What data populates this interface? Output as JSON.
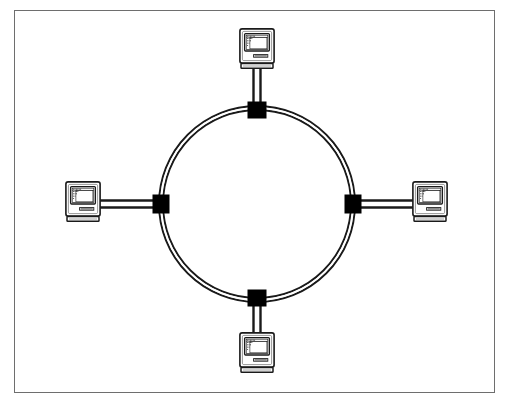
{
  "figure": {
    "title": "Ring network topology diagram",
    "caption": "",
    "frame": {
      "border_color": "#6e6e6e",
      "background_color": "#ffffff",
      "x": 14,
      "y": 10,
      "width": 481,
      "height": 383
    }
  },
  "diagram": {
    "type": "network-topology",
    "topology_name": "ring",
    "line_color": "#1a1a1a",
    "node_fill_color": "#000000",
    "cable_style": "double-line",
    "ring": {
      "center_x": 257,
      "center_y": 204,
      "outer_radius": 98,
      "inner_radius": 94,
      "label": "ring-cable"
    },
    "nodes": [
      {
        "id": "node-top",
        "label": "",
        "x": 257,
        "y": 110,
        "width": 18,
        "height": 16
      },
      {
        "id": "node-right",
        "label": "",
        "x": 353,
        "y": 204,
        "width": 16,
        "height": 18
      },
      {
        "id": "node-bottom",
        "label": "",
        "x": 257,
        "y": 298,
        "width": 18,
        "height": 16
      },
      {
        "id": "node-left",
        "label": "",
        "x": 161,
        "y": 204,
        "width": 16,
        "height": 18
      }
    ],
    "computers": [
      {
        "id": "computer-top",
        "label": "",
        "x": 240,
        "y": 30,
        "width": 36,
        "height": 42,
        "orientation": "top",
        "drop_line": {
          "x1": 257,
          "y1": 72,
          "x2": 257,
          "y2": 110
        }
      },
      {
        "id": "computer-right",
        "label": "",
        "x": 413,
        "y": 183,
        "width": 36,
        "height": 42,
        "orientation": "right",
        "drop_line": {
          "x1": 353,
          "y1": 204,
          "x2": 413,
          "y2": 204
        }
      },
      {
        "id": "computer-bottom",
        "label": "",
        "x": 240,
        "y": 334,
        "width": 36,
        "height": 42,
        "orientation": "bottom",
        "drop_line": {
          "x1": 257,
          "y1": 298,
          "x2": 257,
          "y2": 334
        }
      },
      {
        "id": "computer-left",
        "label": "",
        "x": 66,
        "y": 183,
        "width": 36,
        "height": 42,
        "orientation": "left",
        "drop_line": {
          "x1": 102,
          "y1": 204,
          "x2": 161,
          "y2": 204
        }
      }
    ],
    "computer_icon": {
      "name": "desktop-computer-icon",
      "parts": [
        "case-outline",
        "screen-bezel",
        "screen",
        "dot-grid-window",
        "disk-slot",
        "base-foot"
      ],
      "body_fill": "#ffffff",
      "screen_fill": "#ffffff",
      "outline_color": "#1a1a1a",
      "shade_color": "#8c8c8c"
    }
  },
  "chart_data": {
    "type": "diagram",
    "title": "Ring network topology diagram",
    "nodes": 4,
    "links": 4,
    "description": "Four desktop computers connected by drop cables to four connector taps evenly spaced on a closed ring cable."
  }
}
